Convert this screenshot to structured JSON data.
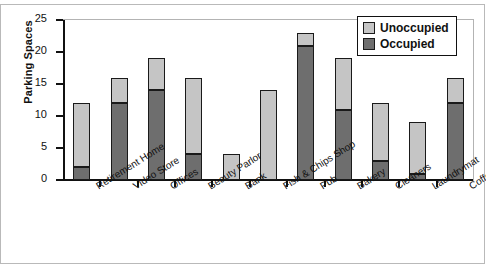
{
  "chart_data": {
    "type": "bar",
    "subtype": "stacked",
    "title": "",
    "xlabel": "",
    "ylabel": "Parking Spaces",
    "ylim": [
      0,
      25
    ],
    "yticks": [
      0,
      5,
      10,
      15,
      20,
      25
    ],
    "grid": false,
    "legend_position": "top-right",
    "categories": [
      "Retirement Home",
      "Video Store",
      "Offices",
      "Beauty Parlor",
      "Bank",
      "Fish & Chips Shop",
      "Pub",
      "Bakery",
      "Cleaners",
      "Laundrymat",
      "Coffee Shop"
    ],
    "series": [
      {
        "name": "Occupied",
        "color": "#6e6e6e",
        "values": [
          2,
          12,
          14,
          4,
          0,
          0,
          21,
          11,
          3,
          1,
          12
        ]
      },
      {
        "name": "Unoccupied",
        "color": "#c5c5c5",
        "values": [
          10,
          4,
          5,
          12,
          4,
          14,
          2,
          8,
          9,
          8,
          4
        ]
      }
    ],
    "totals": [
      12,
      16,
      19,
      16,
      4,
      14,
      23,
      19,
      12,
      9,
      16
    ],
    "stack_order": [
      "Occupied",
      "Unoccupied"
    ]
  },
  "axes": {
    "y_title": "Parking Spaces",
    "y_tick_labels": [
      "0",
      "5",
      "10",
      "15",
      "20",
      "25"
    ]
  },
  "legend": {
    "items": [
      {
        "label": "Unoccupied",
        "swatch": "#c5c5c5"
      },
      {
        "label": "Occupied",
        "swatch": "#6e6e6e"
      }
    ]
  }
}
